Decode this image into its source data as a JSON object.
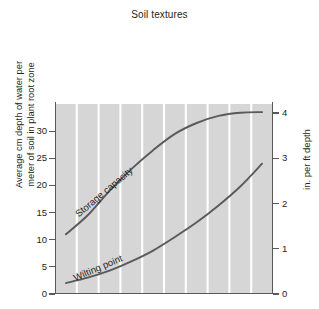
{
  "chart_data": {
    "type": "line",
    "title": "Soil textures",
    "xlabel": "Soil textures",
    "ylabel": "Average cm depth of water per meter of soil in plant root zone",
    "y2label": "in. per ft depth",
    "categories": [
      "Sand",
      "Fine sand",
      "Sandy loam",
      "Fine sandy\nloam",
      "Loam",
      "Silt loam",
      "Light clay loam",
      "Clay loam",
      "Heavy clay loam",
      "Clay"
    ],
    "ylim": [
      0,
      35
    ],
    "yticks": [
      0,
      5,
      10,
      15,
      20,
      25,
      30
    ],
    "y2lim": [
      0,
      4.2
    ],
    "y2ticks": [
      0,
      1,
      2,
      3,
      4
    ],
    "grid": "vertical-white-category-separators",
    "legend": "inline-curve-labels",
    "series": [
      {
        "name": "Storage capacity",
        "values": [
          11.0,
          14.5,
          19.0,
          23.0,
          26.5,
          29.5,
          31.5,
          32.8,
          33.4,
          33.5
        ]
      },
      {
        "name": "Wilting point",
        "values": [
          2.0,
          3.0,
          4.3,
          6.0,
          8.0,
          10.5,
          13.2,
          16.3,
          19.8,
          24.0
        ]
      }
    ]
  },
  "figure": {
    "title": "Soil textures",
    "left_axis_title": "Average cm depth of water per\nmeter of soil in plant root zone",
    "right_axis_title": "in. per ft depth",
    "left_ticks": [
      "0",
      "5",
      "10",
      "15",
      "20",
      "25",
      "30"
    ],
    "right_ticks": [
      "0",
      "1",
      "2",
      "3",
      "4"
    ],
    "category_labels": [
      "Sand",
      "Fine sand",
      "Sandy loam",
      "Fine sandy\nloam",
      "Loam",
      "Silt loam",
      "Light clay loam",
      "Clay loam",
      "Heavy clay loam",
      "Clay"
    ],
    "curve_labels": {
      "storage_capacity": "Storage capacity",
      "wilting_point": "Wilting point"
    },
    "colors": {
      "plot_background": "#d6d6d6",
      "gridline": "#ffffff",
      "axis": "#58595b",
      "curve": "#5a5a5c",
      "text": "#231f20",
      "page_background": "#ffffff"
    }
  }
}
